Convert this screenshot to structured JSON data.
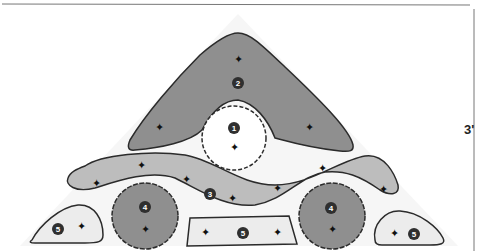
{
  "dimension": {
    "height_label": "3'"
  },
  "colors": {
    "dark_fill": "#8f8f8f",
    "medium_fill": "#bdbdbd",
    "light_fill": "#ececec",
    "outline": "#2b2b2b",
    "badge": "#2f2f2f"
  },
  "zones": [
    {
      "id": "1",
      "label": "1",
      "shape": "scalloped-circle",
      "fill": "white"
    },
    {
      "id": "2",
      "label": "2",
      "shape": "triangle-arch",
      "fill": "dark"
    },
    {
      "id": "3",
      "label": "3",
      "shape": "curved-band",
      "fill": "medium"
    },
    {
      "id": "4a",
      "label": "4",
      "shape": "scalloped-circle",
      "fill": "dark"
    },
    {
      "id": "4b",
      "label": "4",
      "shape": "scalloped-circle",
      "fill": "dark"
    },
    {
      "id": "5a",
      "label": "5",
      "shape": "rounded-wedge",
      "fill": "light"
    },
    {
      "id": "5b",
      "label": "5",
      "shape": "trapezoid",
      "fill": "light"
    },
    {
      "id": "5c",
      "label": "5",
      "shape": "rounded-wedge",
      "fill": "light"
    }
  ]
}
